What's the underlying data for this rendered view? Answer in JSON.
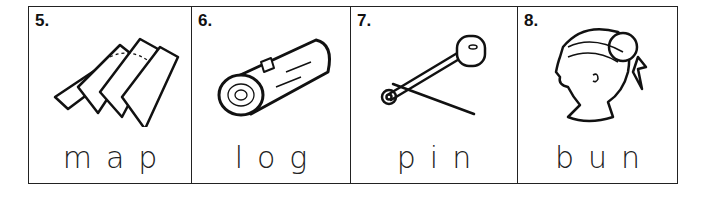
{
  "worksheet": {
    "items": [
      {
        "number": "5.",
        "word": "map",
        "icon": "folded-map-icon"
      },
      {
        "number": "6.",
        "word": "log",
        "icon": "log-icon"
      },
      {
        "number": "7.",
        "word": "pin",
        "icon": "safety-pin-icon"
      },
      {
        "number": "8.",
        "word": "bun",
        "icon": "girl-hair-bun-icon"
      }
    ]
  }
}
